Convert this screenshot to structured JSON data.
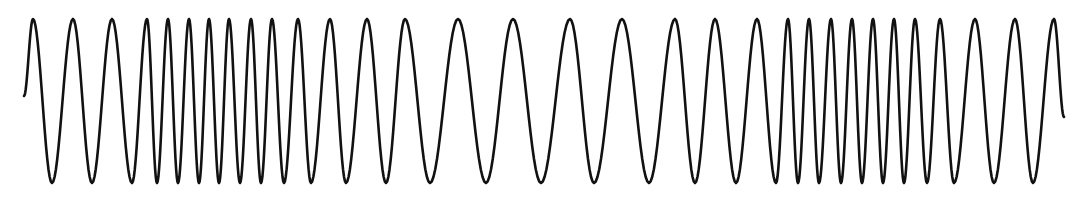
{
  "chart_data": {
    "type": "line",
    "title": "",
    "subtitle": "",
    "xlabel": "",
    "ylabel": "",
    "grid": false,
    "legend": null,
    "stroke_color": "#111111",
    "stroke_width": 2.6,
    "background": "#ffffff",
    "start": {
      "x": 24,
      "y": 96
    },
    "end": {
      "x": 1064,
      "y": 117
    },
    "peak_y": 19,
    "trough_y": 183,
    "extrema_x": [
      33,
      52,
      73,
      92,
      112,
      132,
      147,
      157,
      168,
      178,
      189,
      199,
      209,
      219,
      229,
      240,
      251,
      261,
      272,
      284,
      298,
      311,
      330,
      346,
      367,
      386,
      405,
      430,
      458,
      486,
      513,
      541,
      570,
      594,
      622,
      649,
      675,
      695,
      715,
      736,
      757,
      776,
      788,
      798,
      809,
      819,
      831,
      841,
      852,
      862,
      873,
      883,
      894,
      904,
      915,
      927,
      940,
      954,
      975,
      994,
      1015,
      1033,
      1054
    ],
    "segments": [
      {
        "name": "slow-1",
        "x_range": [
          24,
          130
        ],
        "period_px": 39
      },
      {
        "name": "fast-1",
        "x_range": [
          140,
          290
        ],
        "period_px": 21
      },
      {
        "name": "medium-1",
        "x_range": [
          290,
          440
        ],
        "period_px": 36
      },
      {
        "name": "slow-2",
        "x_range": [
          440,
          700
        ],
        "period_px": 55
      },
      {
        "name": "medium-2",
        "x_range": [
          700,
          780
        ],
        "period_px": 42
      },
      {
        "name": "fast-2",
        "x_range": [
          780,
          920
        ],
        "period_px": 21
      },
      {
        "name": "slow-3",
        "x_range": [
          920,
          1064
        ],
        "period_px": 38
      }
    ]
  }
}
